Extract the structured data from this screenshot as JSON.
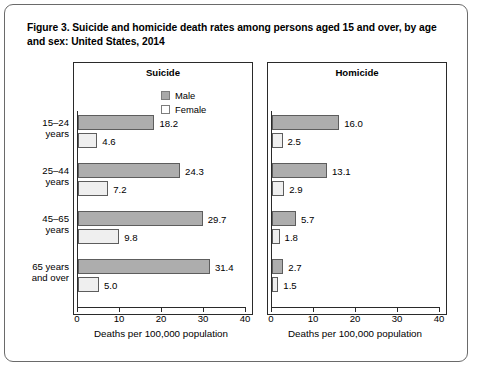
{
  "figure": {
    "title": "Figure 3. Suicide and homicide death rates among persons aged 15 and over, by age and sex: United States, 2014"
  },
  "legend": {
    "items": [
      {
        "label": "Male",
        "color": "#a9a9a9"
      },
      {
        "label": "Female",
        "color": "#ffffff"
      }
    ]
  },
  "axis": {
    "title": "Deaths per 100,000 population",
    "ticks": [
      "0",
      "10",
      "20",
      "30",
      "40"
    ],
    "min": 0,
    "max": 40
  },
  "categories": [
    {
      "line1": "15–24",
      "line2": "years"
    },
    {
      "line1": "25–44",
      "line2": "years"
    },
    {
      "line1": "45–65",
      "line2": "years"
    },
    {
      "line1": "65 years",
      "line2": "and over"
    }
  ],
  "chart_data": {
    "type": "bar",
    "title": "Figure 3. Suicide and homicide death rates among persons aged 15 and over, by age and sex: United States, 2014",
    "orientation": "horizontal",
    "categories": [
      "15–24 years",
      "25–44 years",
      "45–65 years",
      "65 years and over"
    ],
    "xlabel": "Deaths per 100,000 population",
    "ylabel": "",
    "xlim": [
      0,
      40
    ],
    "grid": false,
    "legend_position": "top-right-of-first-panel",
    "panels": [
      {
        "name": "Suicide",
        "series": [
          {
            "name": "Male",
            "values": [
              18.2,
              24.3,
              29.7,
              31.4
            ],
            "labels": [
              "18.2",
              "24.3",
              "29.7",
              "31.4"
            ]
          },
          {
            "name": "Female",
            "values": [
              4.6,
              7.2,
              9.8,
              5.0
            ],
            "labels": [
              "4.6",
              "7.2",
              "9.8",
              "5.0"
            ]
          }
        ]
      },
      {
        "name": "Homicide",
        "series": [
          {
            "name": "Male",
            "values": [
              16.0,
              13.1,
              5.7,
              2.7
            ],
            "labels": [
              "16.0",
              "13.1",
              "5.7",
              "2.7"
            ]
          },
          {
            "name": "Female",
            "values": [
              2.5,
              2.9,
              1.8,
              1.5
            ],
            "labels": [
              "2.5",
              "2.9",
              "1.8",
              "1.5"
            ]
          }
        ]
      }
    ]
  }
}
